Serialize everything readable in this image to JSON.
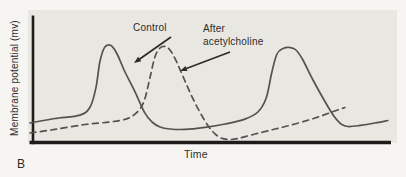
{
  "figure_label": "B",
  "colors": {
    "paper": "#f6f5f1",
    "plot_bg": "#e9e7e1",
    "axis": "#1d1c1a",
    "curve": "#545250",
    "text": "#2e2c2a"
  },
  "chart_data": {
    "type": "line",
    "title": "",
    "xlabel": "Time",
    "ylabel": "Membrane potential (mv)",
    "grid": false,
    "legend_position": "inline-annotations",
    "x_axis": {
      "ticks": "none",
      "units": "arbitrary 0-100"
    },
    "y_axis": {
      "ticks": "none",
      "units": "arbitrary 0-100"
    },
    "series": [
      {
        "name": "Control",
        "line_style": "solid",
        "points": [
          [
            0,
            15.0
          ],
          [
            6.9,
            18.4
          ],
          [
            13.9,
            21.0
          ],
          [
            16.7,
            27.1
          ],
          [
            18.3,
            41.4
          ],
          [
            19.4,
            60.9
          ],
          [
            20.6,
            71.4
          ],
          [
            21.7,
            73.7
          ],
          [
            22.8,
            72.6
          ],
          [
            24.2,
            66.9
          ],
          [
            26.4,
            53.4
          ],
          [
            29.2,
            38.3
          ],
          [
            31.9,
            22.6
          ],
          [
            33.9,
            15.8
          ],
          [
            36.1,
            12.0
          ],
          [
            38.9,
            10.5
          ],
          [
            43.1,
            10.2
          ],
          [
            48.6,
            11.7
          ],
          [
            54.2,
            14.3
          ],
          [
            59.7,
            18.0
          ],
          [
            63.3,
            23.3
          ],
          [
            65.6,
            33.8
          ],
          [
            67.2,
            53.4
          ],
          [
            68.6,
            66.9
          ],
          [
            70.3,
            71.1
          ],
          [
            72.2,
            71.8
          ],
          [
            73.9,
            69.9
          ],
          [
            75.8,
            62.4
          ],
          [
            78.6,
            47.4
          ],
          [
            81.7,
            32.3
          ],
          [
            84.4,
            20.3
          ],
          [
            86.4,
            14.3
          ],
          [
            88.3,
            12.4
          ],
          [
            91.7,
            13.2
          ],
          [
            95.8,
            15.0
          ],
          [
            99.4,
            16.9
          ]
        ]
      },
      {
        "name": "After acetylcholine",
        "line_style": "dashed",
        "points": [
          [
            0,
            7.5
          ],
          [
            6.9,
            10.2
          ],
          [
            15.3,
            13.9
          ],
          [
            22.2,
            15.8
          ],
          [
            27.2,
            18.5
          ],
          [
            30.3,
            24.8
          ],
          [
            31.9,
            33.1
          ],
          [
            33.3,
            48.9
          ],
          [
            34.7,
            64.7
          ],
          [
            36.1,
            71.4
          ],
          [
            37.5,
            72.6
          ],
          [
            38.9,
            69.9
          ],
          [
            40.6,
            61.7
          ],
          [
            42.8,
            48.1
          ],
          [
            45.3,
            33.1
          ],
          [
            48.1,
            18.8
          ],
          [
            50.6,
            9.0
          ],
          [
            52.8,
            4.1
          ],
          [
            55.0,
            2.6
          ],
          [
            57.8,
            3.4
          ],
          [
            62.5,
            6.8
          ],
          [
            68.1,
            10.5
          ],
          [
            73.6,
            14.3
          ],
          [
            79.2,
            18.8
          ],
          [
            83.9,
            23.3
          ],
          [
            87.5,
            26.7
          ]
        ]
      }
    ],
    "annotations": [
      {
        "id": "control",
        "lines": [
          "Control"
        ],
        "arrow_from": [
          171,
          37
        ],
        "arrow_to": [
          134,
          63
        ]
      },
      {
        "id": "after-acetylcholine",
        "lines": [
          "After",
          "acetylcholine"
        ],
        "arrow_from": [
          230,
          52
        ],
        "arrow_to": [
          180,
          71
        ]
      }
    ]
  }
}
